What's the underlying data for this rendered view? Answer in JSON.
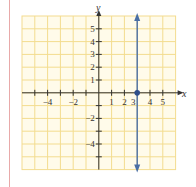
{
  "chart_data": {
    "type": "line",
    "title": "",
    "xlabel": "x",
    "ylabel": "y",
    "xlim": [
      -6,
      6
    ],
    "ylim": [
      -6,
      6
    ],
    "grid": true,
    "x_tick_labels": [
      "-4",
      "-2",
      "1",
      "2",
      "3",
      "4",
      "5"
    ],
    "x_tick_values": [
      -4,
      -2,
      1,
      2,
      3,
      4,
      5
    ],
    "y_tick_labels": [
      "5",
      "4",
      "3",
      "2",
      "1",
      "-2",
      "-4"
    ],
    "y_tick_values": [
      5,
      4,
      3,
      2,
      1,
      -2,
      -4
    ],
    "series": [
      {
        "name": "x = 3",
        "kind": "vertical-line",
        "x": 3,
        "arrows": "both",
        "color": "#4a6fa5"
      }
    ],
    "points": [
      {
        "x": 3,
        "y": 0,
        "color": "#2f4f8a"
      }
    ]
  },
  "colors": {
    "grid": "#f3dc8f",
    "grid_bg": "#fffbea",
    "axis": "#333333",
    "line": "#4a6fa5",
    "margin": "#e8a9a9"
  },
  "labels": {
    "x_axis": "x",
    "y_axis": "y"
  }
}
